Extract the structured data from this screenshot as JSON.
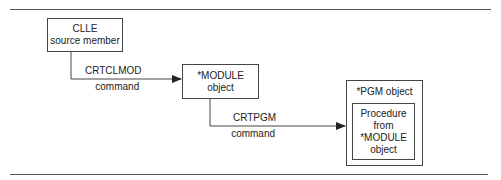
{
  "diagram": {
    "nodes": {
      "source": {
        "line1": "CLLE",
        "line2": "source member"
      },
      "module": {
        "line1": "*MODULE",
        "line2": "object"
      },
      "program": {
        "title": "*PGM object",
        "inner": {
          "line1": "Procedure",
          "line2": "from",
          "line3": "*MODULE",
          "line4": "object"
        }
      }
    },
    "edges": {
      "crtclmod": {
        "line1": "CRTCLMOD",
        "line2": "command"
      },
      "crtpgm": {
        "line1": "CRTPGM",
        "line2": "command"
      }
    }
  }
}
